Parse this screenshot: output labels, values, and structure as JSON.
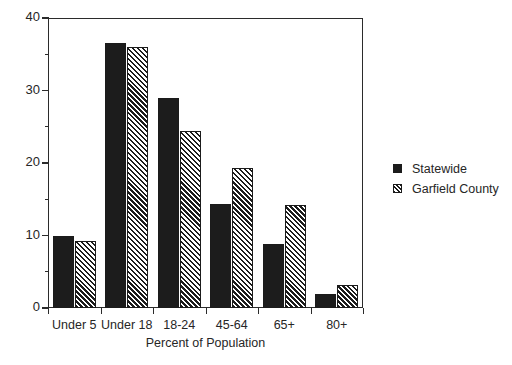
{
  "chart_data": {
    "type": "bar",
    "title": "",
    "subtitle": "",
    "xlabel": "Percent of Population",
    "ylabel": "",
    "categories": [
      "Under 5",
      "Under 18",
      "18-24",
      "45-64",
      "65+",
      "80+"
    ],
    "series": [
      {
        "name": "Statewide",
        "values": [
          10.0,
          36.6,
          29.0,
          14.3,
          8.8,
          2.0
        ],
        "style": "solid",
        "color": "#1c1c1c"
      },
      {
        "name": "Garfield County",
        "values": [
          9.3,
          36.0,
          24.4,
          19.3,
          14.2,
          3.2
        ],
        "style": "hatch",
        "color": "#1c1c1c"
      }
    ],
    "ylim": [
      0,
      40
    ],
    "ytick_values": [
      0,
      10,
      20,
      30,
      40
    ],
    "ytick_labels": [
      "0",
      "10",
      "20",
      "30",
      "40"
    ],
    "yminor_values": [
      5,
      15,
      25,
      35
    ],
    "grid": false,
    "legend_position": "right",
    "legend_entries": [
      "Statewide",
      "Garfield County"
    ],
    "annotations": []
  },
  "legend": {
    "items": [
      {
        "label": "Statewide",
        "swatch": "solid-square-icon"
      },
      {
        "label": "Garfield County",
        "swatch": "hatched-square-icon"
      }
    ]
  },
  "axes": {
    "x_title": "Percent of Population"
  }
}
